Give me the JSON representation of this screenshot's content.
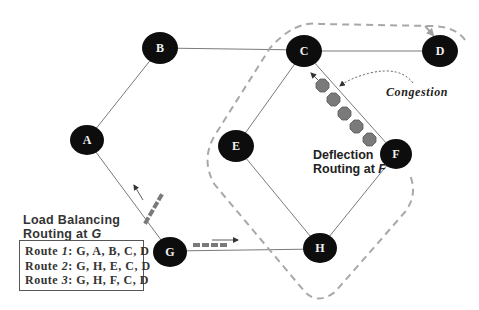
{
  "diagram": {
    "colors": {
      "node_fill": "#0d0d0d",
      "node_label": "#f2f2f2",
      "edge": "#777777",
      "dashed_path": "#a8a8a8",
      "packet_fill": "#7a7a7a",
      "packet_stroke": "#5c5c5c",
      "text": "#222222"
    },
    "nodes": [
      {
        "id": "A",
        "label": "A",
        "x": 87,
        "y": 140
      },
      {
        "id": "B",
        "label": "B",
        "x": 160,
        "y": 48
      },
      {
        "id": "C",
        "label": "C",
        "x": 304,
        "y": 51
      },
      {
        "id": "D",
        "label": "D",
        "x": 440,
        "y": 51
      },
      {
        "id": "E",
        "label": "E",
        "x": 236,
        "y": 146
      },
      {
        "id": "F",
        "label": "F",
        "x": 396,
        "y": 154
      },
      {
        "id": "G",
        "label": "G",
        "x": 170,
        "y": 252
      },
      {
        "id": "H",
        "label": "H",
        "x": 320,
        "y": 248
      }
    ],
    "edges": [
      [
        "A",
        "B"
      ],
      [
        "B",
        "C"
      ],
      [
        "C",
        "D"
      ],
      [
        "C",
        "E"
      ],
      [
        "C",
        "F"
      ],
      [
        "E",
        "H"
      ],
      [
        "F",
        "H"
      ],
      [
        "G",
        "H"
      ],
      [
        "A",
        "G"
      ]
    ],
    "annotations": {
      "congestion": "Congestion",
      "deflection_line1": "Deflection",
      "deflection_line2_prefix": "Routing at ",
      "deflection_line2_node": "F"
    },
    "load_balancing": {
      "title_line1": "Load Balancing",
      "title_line2_prefix": "Routing at ",
      "title_line2_node": "G",
      "routes": [
        {
          "prefix": "Route ",
          "num": "1",
          "path": ": G, A, B, C, D"
        },
        {
          "prefix": "Route ",
          "num": "2",
          "path": ": G, H, E, C, D"
        },
        {
          "prefix": "Route ",
          "num": "3",
          "path": ": G, H, F, C, D"
        }
      ]
    }
  }
}
